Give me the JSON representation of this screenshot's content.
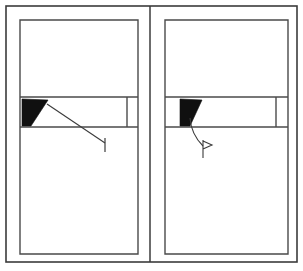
{
  "figure": {
    "title": "Two-panel window elevation detail",
    "canvas": {
      "width": 303,
      "height": 271,
      "background": "#ffffff"
    },
    "ink": {
      "outline": "#3b3b3b",
      "frame": "#4a4a4a",
      "fill_solid": "#101010",
      "leader": "#3b3b3b"
    },
    "layout": {
      "outer_border": {
        "x": 6,
        "y": 6,
        "width": 291,
        "height": 256
      },
      "divider_x": 150,
      "panels": [
        {
          "id": "left-panel",
          "name": "left-window-panel",
          "inner_frame": {
            "x": 20,
            "y": 20,
            "width": 118,
            "height": 234
          },
          "band": {
            "x": 20,
            "y": 97,
            "width": 118,
            "height": 30
          },
          "band_mullion_x": 127,
          "wedge": {
            "name": "left-solid-wedge",
            "points": "22,99 48,100 31,126 22,126"
          },
          "leader": {
            "name": "left-leader-line",
            "kind": "straight",
            "path": "M 47 104 L 105 143",
            "terminator": "vertical-tick",
            "tick": {
              "x": 105,
              "y1": 138,
              "y2": 152
            }
          }
        },
        {
          "id": "right-panel",
          "name": "right-window-panel",
          "inner_frame": {
            "x": 165,
            "y": 20,
            "width": 123,
            "height": 234
          },
          "band": {
            "x": 165,
            "y": 97,
            "width": 123,
            "height": 30
          },
          "band_mullion_x": 276,
          "wedge": {
            "name": "right-solid-wedge",
            "points": "180,99 202,100 190,126 180,126"
          },
          "leader": {
            "name": "right-leader-line",
            "kind": "curved",
            "path": "M 190 118 C 191 132 197 140 203 146",
            "terminator": "flag",
            "flag": "M 203 140 L 203 158 M 203 141 L 212 145 L 203 149"
          }
        }
      ]
    }
  }
}
